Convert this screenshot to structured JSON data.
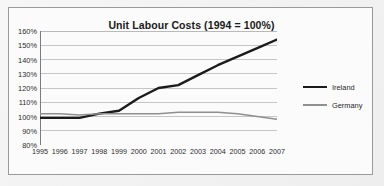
{
  "chart_data": {
    "type": "line",
    "title": "Unit Labour Costs (1994 = 100%)",
    "xlabel": "",
    "ylabel": "",
    "x": [
      1995,
      1996,
      1997,
      1998,
      1999,
      2000,
      2001,
      2002,
      2003,
      2004,
      2005,
      2006,
      2007
    ],
    "categories": [
      "1995",
      "1996",
      "1997",
      "1998",
      "1999",
      "2000",
      "2001",
      "2002",
      "2003",
      "2004",
      "2005",
      "2006",
      "2007"
    ],
    "series": [
      {
        "name": "Ireland",
        "color": "#1b1b1b",
        "values": [
          99,
          99,
          99,
          102,
          104,
          113,
          120,
          122,
          129,
          136,
          142,
          148,
          154
        ]
      },
      {
        "name": "Germany",
        "color": "#8f8f8f",
        "values": [
          102,
          102,
          101,
          102,
          102,
          102,
          102,
          103,
          103,
          103,
          102,
          100,
          98
        ]
      }
    ],
    "ylim": [
      80,
      160
    ],
    "yticks": [
      80,
      90,
      100,
      110,
      120,
      130,
      140,
      150,
      160
    ],
    "ytick_labels": [
      "80%",
      "90%",
      "100%",
      "110%",
      "120%",
      "130%",
      "140%",
      "150%",
      "160%"
    ],
    "xlim": [
      1995,
      2007
    ],
    "grid": "horizontal",
    "legend_position": "right",
    "legend_entries": [
      "Ireland",
      "Germany"
    ]
  },
  "legend": {
    "items": [
      {
        "label": "Ireland"
      },
      {
        "label": "Germany"
      }
    ]
  }
}
